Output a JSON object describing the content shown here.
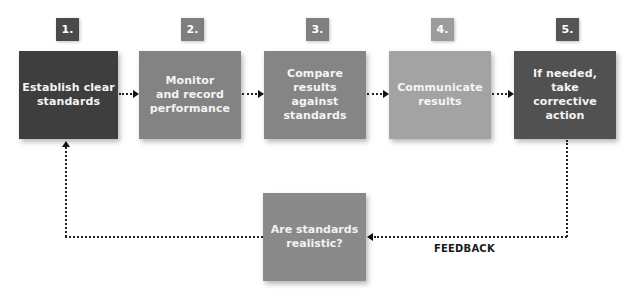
{
  "diagram": {
    "type": "flowchart",
    "steps": [
      {
        "number": "1.",
        "label": "Establish clear\nstandards",
        "badge_color": "#4a4a4a",
        "box_color": "#3e3e3e"
      },
      {
        "number": "2.",
        "label": "Monitor\nand record\nperformance",
        "badge_color": "#7f7f7f",
        "box_color": "#838383"
      },
      {
        "number": "3.",
        "label": "Compare\nresults\nagainst\nstandards",
        "badge_color": "#7f7f7f",
        "box_color": "#858585"
      },
      {
        "number": "4.",
        "label": "Communicate\nresults",
        "badge_color": "#9c9c9c",
        "box_color": "#a3a3a3"
      },
      {
        "number": "5.",
        "label": "If needed,\ntake\ncorrective\naction",
        "badge_color": "#555555",
        "box_color": "#515151"
      }
    ],
    "feedback_box": {
      "label": "Are standards\nrealistic?",
      "color": "#8a8a8a"
    },
    "feedback_label": "FEEDBACK",
    "connectors": [
      {
        "from": "1",
        "to": "2",
        "style": "dotted-arrow"
      },
      {
        "from": "2",
        "to": "3",
        "style": "dotted-arrow"
      },
      {
        "from": "3",
        "to": "4",
        "style": "dotted-arrow"
      },
      {
        "from": "4",
        "to": "5",
        "style": "dotted-arrow"
      },
      {
        "from": "5",
        "to": "feedback",
        "style": "dotted-arrow"
      },
      {
        "from": "feedback",
        "to": "1",
        "style": "dotted-arrow"
      }
    ]
  }
}
